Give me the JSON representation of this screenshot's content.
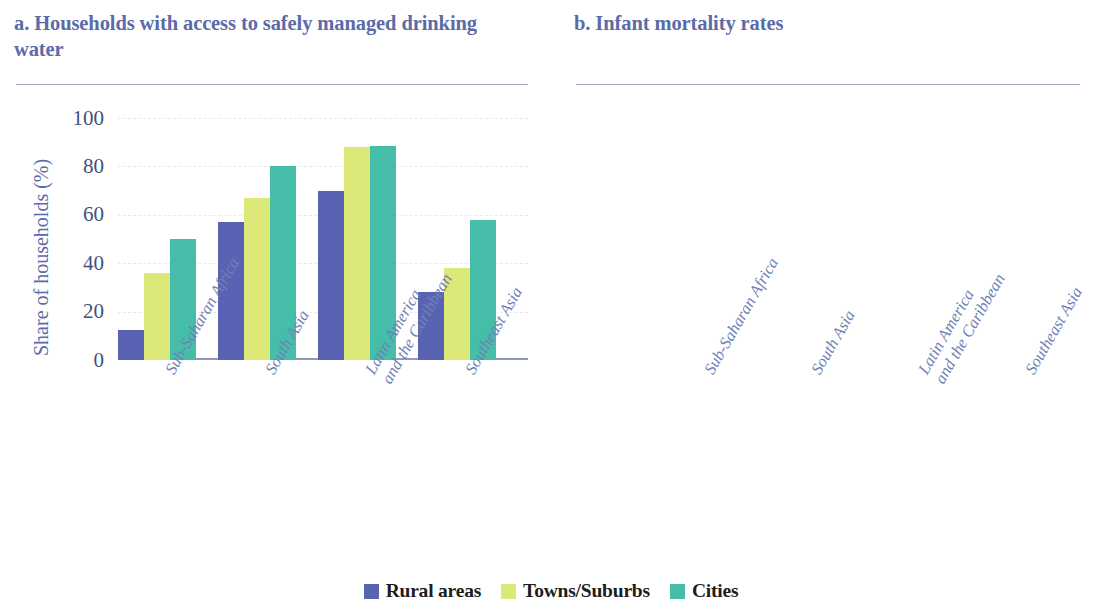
{
  "figure": {
    "colors": {
      "rural": "#5a62b4",
      "towns": "#dce878",
      "cities": "#46bda9",
      "title": "#5b6ba8",
      "axis_text": "#3e5182",
      "xlabel_text": "#6e81b5",
      "rule": "#9aa5c4",
      "baseline": "#8d9ab9",
      "gridline": "#e9e9ec"
    }
  },
  "legend": {
    "position": "bottom-center",
    "items": [
      {
        "label": "Rural areas",
        "color": "#5a62b4"
      },
      {
        "label": "Towns/Suburbs",
        "color": "#dce878"
      },
      {
        "label": "Cities",
        "color": "#46bda9"
      }
    ]
  },
  "chart_data": [
    {
      "type": "bar",
      "panel": "a",
      "title": "a. Households with access to safely managed drinking water",
      "title_line1": "a. Households with access to safely",
      "title_line2": "managed drinking water",
      "xlabel": "",
      "ylabel": "Share of households (%)",
      "ylim": [
        0,
        100
      ],
      "yticks": [
        0,
        20,
        40,
        60,
        80,
        100
      ],
      "ytick_labels": [
        "0",
        "20",
        "40",
        "60",
        "80",
        "100"
      ],
      "grid": true,
      "categories": [
        "Sub-Saharan Africa",
        "South Asia",
        "Latin America and the Caribbean",
        "Southeast Asia"
      ],
      "category_lines": [
        [
          "Sub-Saharan Africa"
        ],
        [
          "South Asia"
        ],
        [
          "Latin America",
          "and the Caribbean"
        ],
        [
          "Southeast Asia"
        ]
      ],
      "series": [
        {
          "name": "Rural areas",
          "color": "#5a62b4",
          "values": [
            12.5,
            57.0,
            70.0,
            28.0
          ]
        },
        {
          "name": "Towns/Suburbs",
          "color": "#dce878",
          "values": [
            36.0,
            67.0,
            88.0,
            38.0
          ]
        },
        {
          "name": "Cities",
          "color": "#46bda9",
          "values": [
            50.0,
            80.0,
            88.5,
            58.0
          ]
        }
      ]
    },
    {
      "type": "bar",
      "panel": "b",
      "title": "b. Infant mortality rates",
      "title_line1": "b. Infant mortality rates",
      "title_line2": "",
      "xlabel": "",
      "ylabel": "Share of children (%)",
      "ylim": [
        0,
        4
      ],
      "yticks": [
        0,
        1,
        2,
        3,
        4
      ],
      "ytick_labels": [
        "0",
        "1",
        "2",
        "3",
        "4"
      ],
      "grid": true,
      "categories": [
        "Sub-Saharan Africa",
        "South Asia",
        "Latin America and the Caribbean",
        "Southeast Asia"
      ],
      "category_lines": [
        [
          "Sub-Saharan Africa"
        ],
        [
          "South Asia"
        ],
        [
          "Latin America",
          "and the Caribbean"
        ],
        [
          "Southeast Asia"
        ]
      ],
      "series": [
        {
          "name": "Rural areas",
          "color": "#5a62b4",
          "values": [
            3.77,
            3.87,
            2.25,
            2.62
          ]
        },
        {
          "name": "Towns/Suburbs",
          "color": "#dce878",
          "values": [
            3.6,
            3.37,
            1.85,
            1.52
          ]
        },
        {
          "name": "Cities",
          "color": "#46bda9",
          "values": [
            3.48,
            2.77,
            1.98,
            1.68
          ]
        }
      ]
    }
  ]
}
